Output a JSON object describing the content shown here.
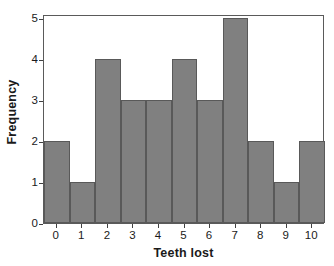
{
  "chart_data": {
    "type": "bar",
    "title": "",
    "subtitle": "",
    "xlabel": "Teeth lost",
    "ylabel": "Frequency",
    "categories": [
      "0",
      "1",
      "2",
      "3",
      "4",
      "5",
      "6",
      "7",
      "8",
      "9",
      "10"
    ],
    "values": [
      2,
      1,
      4,
      3,
      3,
      4,
      3,
      5,
      2,
      1,
      2
    ],
    "xtick_labels": [
      "0",
      "1",
      "2",
      "3",
      "4",
      "5",
      "6",
      "7",
      "8",
      "9",
      "10"
    ],
    "ytick_labels": [
      "0",
      "1",
      "2",
      "3",
      "4",
      "5"
    ],
    "ytick_values": [
      0,
      1,
      2,
      3,
      4,
      5
    ],
    "ylim": [
      0,
      5.1
    ],
    "grid": false,
    "legend": null,
    "bar_gap": 0,
    "annotations": [],
    "colors": {
      "bar_fill": "#808080",
      "bar_edge": "#595959",
      "axis": "#5a5a5a",
      "text": "#1a1a1a",
      "background": "#ffffff"
    }
  }
}
